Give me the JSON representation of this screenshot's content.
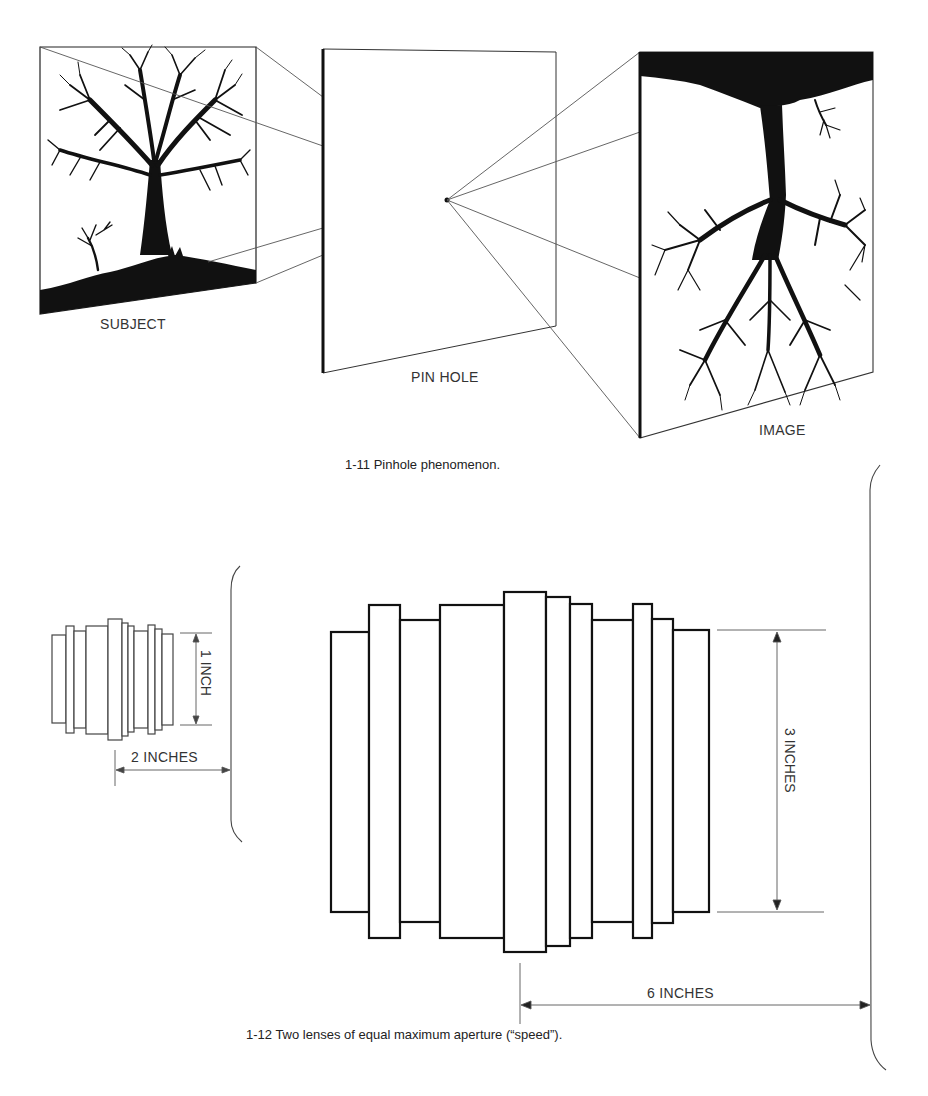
{
  "figure_1_11": {
    "caption": "1-11  Pinhole phenomenon.",
    "labels": {
      "subject": "SUBJECT",
      "pinhole": "PIN HOLE",
      "image": "IMAGE"
    },
    "panels": [
      {
        "name": "subject",
        "content": "upright tree silhouette on a hill"
      },
      {
        "name": "pinhole",
        "content": "blank plane with a single pinhole point"
      },
      {
        "name": "image",
        "content": "inverted tree silhouette"
      }
    ]
  },
  "figure_1_12": {
    "caption": "1-12  Two lenses of equal maximum aperture (“speed”).",
    "small_lens": {
      "height_label": "1 INCH",
      "length_label": "2 INCHES"
    },
    "large_lens": {
      "height_label": "3 INCHES",
      "length_label": "6 INCHES"
    }
  },
  "colors": {
    "ink": "#111111",
    "thin_line": "#555555",
    "background": "#ffffff"
  }
}
